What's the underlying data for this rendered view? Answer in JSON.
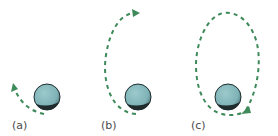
{
  "figure": {
    "panels": [
      {
        "id": "a",
        "label": "(a)",
        "orbit": "short arc leaving planet, arrow pointing up-left"
      },
      {
        "id": "b",
        "label": "(b)",
        "orbit": "half-ellipse arc, arrow pointing right at top"
      },
      {
        "id": "c",
        "label": "(c)",
        "orbit": "full closed elliptical orbit, arrow returning near planet"
      }
    ],
    "colors": {
      "orbit": "#3f8a5a",
      "planet_fill": "#86b9bd",
      "planet_shadow": "#1f2b2d",
      "label": "#4a4a4a"
    }
  }
}
